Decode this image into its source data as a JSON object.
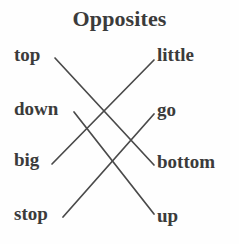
{
  "worksheet": {
    "title": "Opposites",
    "background_color": "#fefefe",
    "text_color": "#3b3b3b",
    "line_color": "#4a4a4a"
  },
  "left_column": {
    "items": [
      {
        "label": "top",
        "x": 14,
        "y": 45
      },
      {
        "label": "down",
        "x": 14,
        "y": 99
      },
      {
        "label": "big",
        "x": 14,
        "y": 150
      },
      {
        "label": "stop",
        "x": 14,
        "y": 204
      }
    ]
  },
  "right_column": {
    "items": [
      {
        "label": "little",
        "x": 157,
        "y": 45
      },
      {
        "label": "go",
        "x": 157,
        "y": 100
      },
      {
        "label": "bottom",
        "x": 157,
        "y": 152
      },
      {
        "label": "up",
        "x": 157,
        "y": 206
      }
    ]
  },
  "connections": [
    {
      "from": "top",
      "to": "bottom",
      "x1": 55,
      "y1": 58,
      "x2": 154,
      "y2": 165
    },
    {
      "from": "down",
      "to": "up",
      "x1": 74,
      "y1": 112,
      "x2": 154,
      "y2": 214
    },
    {
      "from": "big",
      "to": "little",
      "x1": 52,
      "y1": 164,
      "x2": 154,
      "y2": 60
    },
    {
      "from": "stop",
      "to": "go",
      "x1": 63,
      "y1": 217,
      "x2": 154,
      "y2": 114
    }
  ]
}
